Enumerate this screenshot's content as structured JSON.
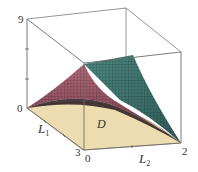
{
  "figure": {
    "type": "3d-surface-plot",
    "region_label": "D",
    "axes": {
      "z": {
        "label": "",
        "ticks": [
          "0",
          "9"
        ],
        "top": "9",
        "bottom": "0"
      },
      "x": {
        "label": "L",
        "subscript": "1",
        "start": "0",
        "end": "3"
      },
      "y": {
        "label": "L",
        "subscript": "2",
        "start": "0",
        "end": "2"
      }
    },
    "colors": {
      "box_edge": "#6b6b6b",
      "domain_fill": "#ecdcb0",
      "surface_pink": "#9a5a6a",
      "surface_green": "#3c7a72",
      "surface_dark": "#2a1a1e",
      "grid": "#3a2228"
    }
  }
}
